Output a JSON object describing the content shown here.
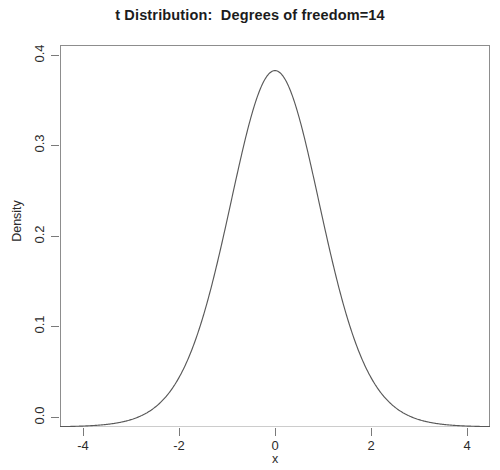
{
  "chart_data": {
    "type": "line",
    "title": "t Distribution:  Degrees of freedom=14",
    "xlabel": "x",
    "ylabel": "Density",
    "grid": false,
    "legend": false,
    "distribution": "student-t",
    "df": 14,
    "xlim": [
      -4.6,
      4.6
    ],
    "ylim": [
      0.0,
      0.42
    ],
    "xticks": [
      -4,
      -2,
      0,
      2,
      4
    ],
    "xticklabels": [
      "-4",
      "-2",
      "0",
      "2",
      "4"
    ],
    "yticks": [
      0.0,
      0.1,
      0.2,
      0.3,
      0.4
    ],
    "yticklabels": [
      "0.0",
      "0.1",
      "0.2",
      "0.3",
      "0.4"
    ],
    "peak": {
      "x": 0,
      "y": 0.3948
    },
    "baseline": 0.0,
    "line_color": "#595959",
    "baseline_color": "#e2e2e2",
    "frame_color": "#8d8d8d",
    "x": [
      -4.6,
      -4.4,
      -4.2,
      -4.0,
      -3.8,
      -3.6,
      -3.4,
      -3.2,
      -3.0,
      -2.8,
      -2.6,
      -2.4,
      -2.2,
      -2.0,
      -1.8,
      -1.6,
      -1.4,
      -1.2,
      -1.0,
      -0.8,
      -0.6,
      -0.4,
      -0.2,
      0.0,
      0.2,
      0.4,
      0.6,
      0.8,
      1.0,
      1.2,
      1.4,
      1.6,
      1.8,
      2.0,
      2.2,
      2.4,
      2.6,
      2.8,
      3.0,
      3.2,
      3.4,
      3.6,
      3.8,
      4.0,
      4.2,
      4.4,
      4.6
    ],
    "y": [
      0.0013,
      0.0017,
      0.0022,
      0.0029,
      0.0038,
      0.0051,
      0.0068,
      0.0091,
      0.0123,
      0.0167,
      0.0228,
      0.0312,
      0.0428,
      0.0586,
      0.0797,
      0.1069,
      0.1406,
      0.1801,
      0.2234,
      0.2669,
      0.3062,
      0.3372,
      0.3568,
      0.3948,
      0.3568,
      0.3372,
      0.3062,
      0.2669,
      0.2234,
      0.1801,
      0.1406,
      0.1069,
      0.0797,
      0.0586,
      0.0428,
      0.0312,
      0.0228,
      0.0167,
      0.0123,
      0.0091,
      0.0068,
      0.0051,
      0.0038,
      0.0029,
      0.0022,
      0.0017,
      0.0013
    ]
  },
  "axes": {
    "xticklabels": [
      "-4",
      "-2",
      "0",
      "2",
      "4"
    ],
    "yticklabels": [
      "0.0",
      "0.1",
      "0.2",
      "0.3",
      "0.4"
    ],
    "xlabel": "x",
    "ylabel": "Density"
  },
  "title": "t Distribution:  Degrees of freedom=14"
}
